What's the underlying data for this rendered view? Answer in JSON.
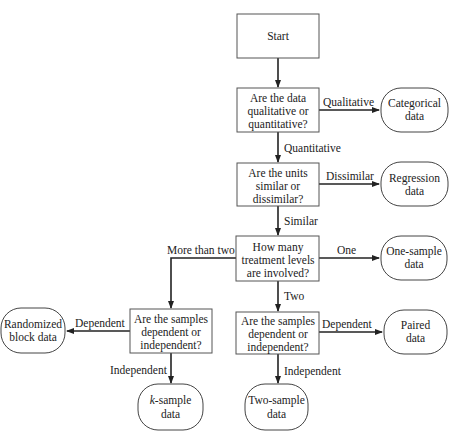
{
  "nodes": {
    "start": {
      "lines": [
        "Start"
      ]
    },
    "q_data_type": {
      "lines": [
        "Are the data",
        "qualitative or",
        "quantitative?"
      ]
    },
    "q_units": {
      "lines": [
        "Are the units",
        "similar or",
        "dissimilar?"
      ]
    },
    "q_levels": {
      "lines": [
        "How many",
        "treatment levels",
        "are involved?"
      ]
    },
    "q_samples_left": {
      "lines": [
        "Are the samples",
        "dependent or",
        "independent?"
      ]
    },
    "q_samples_right": {
      "lines": [
        "Are the samples",
        "dependent or",
        "independent?"
      ]
    },
    "categorical": {
      "lines": [
        "Categorical",
        "data"
      ]
    },
    "regression": {
      "lines": [
        "Regression",
        "data"
      ]
    },
    "one_sample": {
      "lines": [
        "One-sample",
        "data"
      ]
    },
    "paired": {
      "lines": [
        "Paired",
        "data"
      ]
    },
    "randomized_block": {
      "lines": [
        "Randomized",
        "block data"
      ]
    },
    "k_sample": {
      "italic": "k",
      "rest": "-sample",
      "line2": "data"
    },
    "two_sample": {
      "lines": [
        "Two-sample",
        "data"
      ]
    }
  },
  "edges": {
    "qualitative": "Qualitative",
    "quantitative": "Quantitative",
    "dissimilar": "Dissimilar",
    "similar": "Similar",
    "one": "One",
    "two": "Two",
    "more_than_two": "More than two",
    "dependent_left": "Dependent",
    "independent_left": "Independent",
    "dependent_right": "Dependent",
    "independent_right": "Independent"
  }
}
